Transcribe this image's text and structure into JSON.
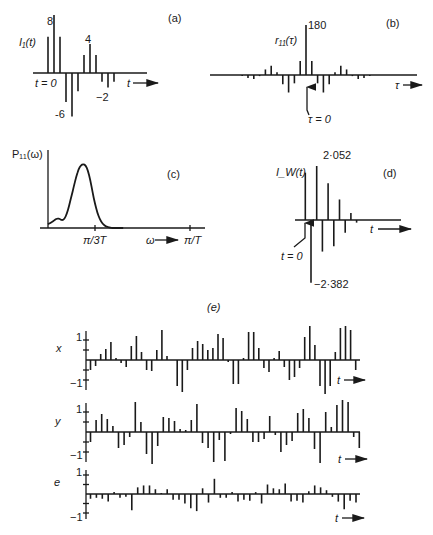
{
  "chart_data": [
    {
      "id": "a",
      "type": "stem",
      "panel_label": "(a)",
      "ylabel": "I₁(t)",
      "xlabel": "t",
      "origin_label": "t = 0",
      "x": [
        -1,
        0,
        1,
        2,
        3,
        4,
        5,
        6,
        7,
        8,
        9,
        10,
        11
      ],
      "values": [
        5,
        8,
        5,
        -4,
        -6,
        -2.5,
        2.5,
        4,
        2.5,
        -1.2,
        -2,
        -1.2,
        0
      ],
      "annotations": [
        {
          "text": "8",
          "x": 0,
          "value": 8
        },
        {
          "text": "4",
          "x": 6,
          "value": 4
        },
        {
          "text": "-6",
          "x": 4,
          "value": -6
        },
        {
          "text": "−2",
          "x": 10,
          "value": -2
        }
      ]
    },
    {
      "id": "b",
      "type": "stem",
      "panel_label": "(b)",
      "ylabel": "r₁₁(τ)",
      "xlabel": "τ",
      "origin_label": "τ = 0",
      "x": [
        -11,
        -10,
        -9,
        -8,
        -7,
        -6,
        -5,
        -4,
        -3,
        -2,
        -1,
        0,
        1,
        2,
        3,
        4,
        5,
        6,
        7,
        8,
        9,
        10,
        11
      ],
      "values": [
        -4,
        -11,
        -14,
        -4,
        20,
        33,
        10,
        -33,
        -63,
        -30,
        50,
        180,
        50,
        -30,
        -63,
        -33,
        10,
        33,
        20,
        -4,
        -14,
        -11,
        -4
      ],
      "annotations": [
        {
          "text": "180",
          "x": 0,
          "value": 180
        }
      ]
    },
    {
      "id": "c",
      "type": "line",
      "panel_label": "(c)",
      "ylabel": "P₁₁(ω)",
      "xlabel": "ω",
      "xticks": [
        "π/3T",
        "π/T"
      ],
      "x": [
        0,
        0.05,
        0.1,
        0.15,
        0.2,
        0.25,
        0.3,
        0.35,
        0.4,
        0.45,
        0.5,
        0.55,
        0.6,
        0.65,
        0.7,
        0.75,
        0.8,
        0.85,
        0.9,
        0.95,
        1.0,
        1.05,
        1.1,
        1.15,
        1.2,
        1.25,
        1.3,
        1.35,
        1.4,
        1.5,
        1.6
      ],
      "x_units": "fraction of π/3T",
      "values": [
        0.06,
        0.08,
        0.1,
        0.13,
        0.15,
        0.14,
        0.12,
        0.14,
        0.22,
        0.35,
        0.5,
        0.65,
        0.8,
        0.92,
        0.98,
        1.0,
        0.98,
        0.9,
        0.75,
        0.55,
        0.38,
        0.24,
        0.14,
        0.08,
        0.04,
        0.02,
        0.01,
        0.0,
        0.0,
        0.0,
        0.0
      ]
    },
    {
      "id": "d",
      "type": "stem",
      "panel_label": "(d)",
      "ylabel": "I_W(t)",
      "xlabel": "t",
      "origin_label": "t = 0",
      "x": [
        -1,
        0,
        1,
        2,
        3,
        4,
        5,
        6,
        7,
        8,
        9
      ],
      "values": [
        1.8,
        -2.382,
        2.052,
        -1.2,
        1.4,
        -1.0,
        0.78,
        -0.48,
        0.27,
        -0.1,
        0
      ],
      "annotations": [
        {
          "text": "2·052",
          "x": 1,
          "value": 2.052
        },
        {
          "text": "−2·382",
          "x": 0,
          "value": -2.382
        }
      ]
    },
    {
      "id": "e",
      "type": "stem",
      "panel_label": "(e)",
      "xlabel": "t",
      "ylim": [
        -1,
        1
      ],
      "yticks": [
        "1",
        "−1"
      ],
      "series": [
        {
          "name": "x",
          "values": [
            -0.5,
            -0.3,
            0.3,
            0.55,
            0.9,
            0.1,
            -0.15,
            -0.35,
            0.7,
            1.2,
            0.4,
            -0.5,
            -0.55,
            0.5,
            1.5,
            0.2,
            0,
            -1.3,
            -1.6,
            -0.5,
            0.6,
            0.95,
            0.8,
            0.5,
            0.6,
            1.3,
            1.1,
            -0.1,
            -1.2,
            -1.2,
            0.1,
            1.4,
            1.4,
            0.6,
            -0.4,
            -0.6,
            0.1,
            0.45,
            -0.35,
            -1.0,
            -0.85,
            -0.4,
            1.15,
            1.7,
            0.75,
            -1.3,
            -1.7,
            -1.3,
            0.4,
            1.6,
            1.7,
            1.5,
            -0.5
          ]
        },
        {
          "name": "y",
          "values": [
            -0.5,
            0.6,
            0.9,
            0.65,
            0.3,
            -0.8,
            -0.65,
            -0.25,
            1.5,
            0.5,
            -1.1,
            -1.6,
            -0.7,
            0.75,
            0.7,
            0.55,
            0.15,
            0.1,
            0.6,
            1.4,
            -0.55,
            -0.8,
            -1.5,
            -0.4,
            -1.45,
            -0.1,
            1.2,
            1.05,
            0.65,
            -0.5,
            -0.5,
            -0.35,
            0.8,
            -0.15,
            -1.0,
            -0.65,
            -0.45,
            0.95,
            1.15,
            0.7,
            -0.85,
            -1.55,
            1.0,
            0.25,
            1.35,
            1.6,
            1.5,
            -0.25,
            -0.8
          ]
        },
        {
          "name": "e",
          "values": [
            -0.25,
            -0.2,
            -0.25,
            -0.4,
            0.1,
            -0.2,
            -0.15,
            -0.85,
            0.35,
            0.45,
            0.45,
            0.25,
            0.05,
            0.25,
            -0.3,
            -0.3,
            -0.5,
            -0.75,
            -0.9,
            0.3,
            -0.45,
            0.8,
            -0.2,
            -0.2,
            0.1,
            -0.4,
            -0.3,
            -0.35,
            0.1,
            -0.5,
            0.5,
            0.3,
            0.25,
            0.55,
            -0.4,
            -0.35,
            -0.45,
            0.15,
            0.45,
            0.35,
            0.2,
            -0.15,
            -0.4,
            -0.8,
            -0.35,
            -0.45
          ]
        }
      ]
    }
  ]
}
